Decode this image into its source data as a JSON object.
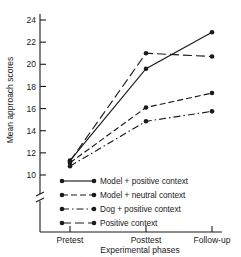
{
  "chart_data": {
    "type": "line",
    "title": "",
    "xlabel": "Experimental phases",
    "ylabel": "Mean approach scores",
    "categories": [
      "Pretest",
      "Posttest",
      "Follow-up"
    ],
    "ylim": [
      10,
      24
    ],
    "yticks": [
      10,
      12,
      14,
      16,
      18,
      20,
      22,
      24
    ],
    "ytick_labels": [
      "10",
      "12",
      "14",
      "16",
      "18",
      "20",
      "22",
      "24"
    ],
    "y_axis_break": true,
    "grid": false,
    "legend_position": "lower-left-inside",
    "series": [
      {
        "name": "Model + positive context",
        "style": "solid",
        "marker": "filled-circle",
        "color": "#1a1a1a",
        "values": [
          11.3,
          19.6,
          22.9
        ]
      },
      {
        "name": "Model + neutral context",
        "style": "dashed",
        "marker": "filled-circle",
        "color": "#1a1a1a",
        "values": [
          11.1,
          16.1,
          17.4
        ]
      },
      {
        "name": "Dog + positive context",
        "style": "dash-dot",
        "marker": "filled-circle",
        "color": "#1a1a1a",
        "values": [
          10.8,
          14.85,
          15.75
        ]
      },
      {
        "name": "Positive context",
        "style": "long-dash",
        "marker": "filled-circle",
        "color": "#1a1a1a",
        "values": [
          11.25,
          21.0,
          20.7
        ]
      }
    ]
  },
  "axes": {
    "y_title": "Mean approach scores",
    "x_title": "Experimental phases",
    "y_tick_labels": [
      "24",
      "22",
      "20",
      "18",
      "16",
      "14",
      "12",
      "10"
    ],
    "x_tick_labels": [
      "Pretest",
      "Posttest",
      "Follow-up"
    ]
  },
  "legend": {
    "entries": [
      {
        "label": "Model + positive context"
      },
      {
        "label": "Model + neutral context"
      },
      {
        "label": "Dog + positive context"
      },
      {
        "label": "Positive context"
      }
    ]
  }
}
